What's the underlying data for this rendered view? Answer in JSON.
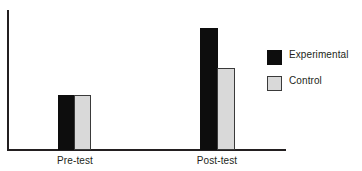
{
  "chart_data": {
    "type": "bar",
    "title": "",
    "subtitle": "",
    "xlabel": "",
    "ylabel": "",
    "categories": [
      "Pre-test",
      "Post-test"
    ],
    "series": [
      {
        "name": "Experimental",
        "values": [
          55,
          122
        ],
        "color": "#0d0d0d"
      },
      {
        "name": "Control",
        "values": [
          55,
          82
        ],
        "color": "#d9d9d9"
      }
    ],
    "ylim": [
      0,
      141
    ],
    "grid": false,
    "legend_position": "right",
    "axis_color": "#231f20",
    "background_color": "#ffffff"
  },
  "axes": {
    "y_axis_name": "y-axis-line",
    "x_axis_name": "x-axis-line",
    "tick_labels": [
      "Pre-test",
      "Post-test"
    ]
  },
  "legend": {
    "items": [
      {
        "label": "Experimental",
        "swatch": "filled-black-square"
      },
      {
        "label": "Control",
        "swatch": "filled-light-gray-square"
      }
    ]
  }
}
